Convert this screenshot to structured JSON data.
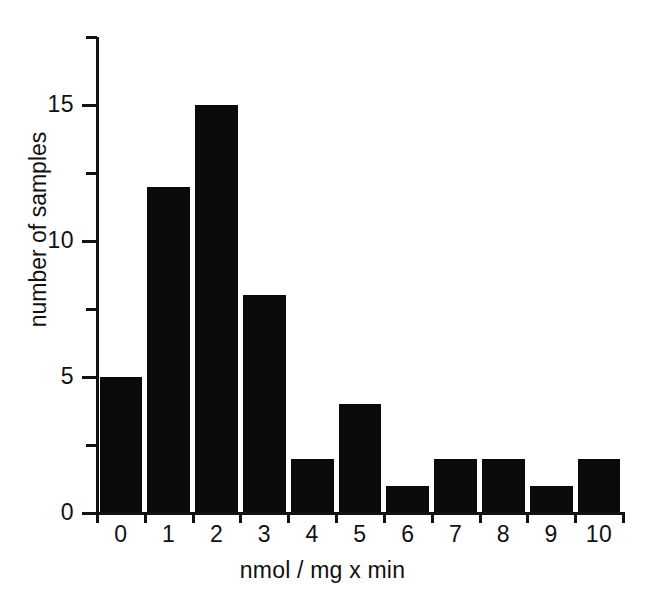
{
  "chart_data": {
    "type": "bar",
    "title": "",
    "subtitle": "",
    "xlabel": "nmol / mg x min",
    "ylabel": "number of samples",
    "categories": [
      "0",
      "1",
      "2",
      "3",
      "4",
      "5",
      "6",
      "7",
      "8",
      "9",
      "10"
    ],
    "values": [
      5,
      12,
      15,
      8,
      2,
      4,
      1,
      2,
      2,
      1,
      2
    ],
    "ylim": [
      0,
      17.5
    ],
    "xlim": [
      -0.5,
      10.5
    ],
    "y_major_ticks": [
      0,
      5,
      10,
      15
    ],
    "y_minor_ticks": [
      2.5,
      7.5,
      12.5,
      17.5
    ],
    "y_tick_labels": [
      "0",
      "5",
      "10",
      "15"
    ],
    "grid": false,
    "legend": false,
    "legend_position": "none",
    "bar_color": "#0a0a0a",
    "axis_color": "#111111",
    "background_color": "#ffffff",
    "annotations": []
  },
  "figure": {
    "alt": "Histogram of number of samples versus nmol / mg x min"
  }
}
